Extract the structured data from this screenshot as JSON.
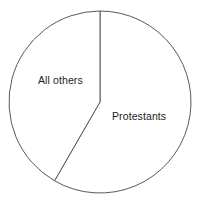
{
  "chart_data": {
    "type": "pie",
    "title": "",
    "subtitle": "",
    "xlabel": "",
    "ylabel": "",
    "grid": false,
    "legend_position": "none",
    "labels_inside_slices": true,
    "start_angle_deg": 0,
    "direction": "clockwise",
    "categories": [
      "Protestants",
      "All others"
    ],
    "values": [
      58,
      42
    ],
    "value_unit": "percent",
    "slices": [
      {
        "name": "Protestants",
        "label": "Protestants",
        "value": 58,
        "angle_deg": 210,
        "start_angle_deg": 0,
        "end_angle_deg": 210,
        "fill_color": "#ffffff",
        "stroke_color": "#55585c"
      },
      {
        "name": "All others",
        "label": "All others",
        "value": 42,
        "angle_deg": 150,
        "start_angle_deg": 210,
        "end_angle_deg": 360,
        "fill_color": "#ffffff",
        "stroke_color": "#55585c"
      }
    ],
    "annotations": []
  },
  "figure": {
    "background_color": "#ffffff",
    "outline_color": "#55585c",
    "text_color": "#1d1d1d",
    "center_x": 100,
    "center_y": 102,
    "radius": 91
  },
  "labels": {
    "all_others": "All others",
    "protestants": "Protestants"
  }
}
